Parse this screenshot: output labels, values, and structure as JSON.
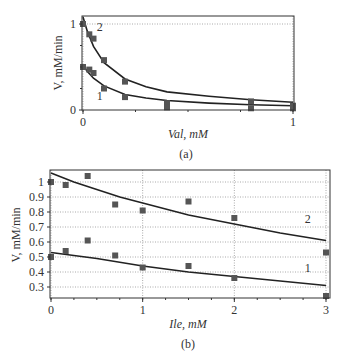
{
  "chart_data": [
    {
      "panel": "(a)",
      "type": "scatter",
      "xlabel": "Val, mM",
      "ylabel": "V, mM/min",
      "xlim": [
        0,
        1
      ],
      "ylim": [
        0,
        1.1
      ],
      "xticks": [
        0,
        1
      ],
      "xtick_labels": [
        "0",
        "1"
      ],
      "yticks": [
        0,
        1
      ],
      "ytick_labels": [
        "0",
        "1"
      ],
      "grid": "dotted reference line at y=1 and x=1",
      "series": [
        {
          "name": "2",
          "points": [
            [
              0,
              1.0
            ],
            [
              0.03,
              0.88
            ],
            [
              0.05,
              0.83
            ],
            [
              0.1,
              0.58
            ],
            [
              0.2,
              0.33
            ],
            [
              0.4,
              0.08
            ],
            [
              0.8,
              0.1
            ],
            [
              1.0,
              0.05
            ]
          ],
          "fit": [
            [
              0,
              1.08
            ],
            [
              0.02,
              0.92
            ],
            [
              0.05,
              0.74
            ],
            [
              0.1,
              0.55
            ],
            [
              0.2,
              0.36
            ],
            [
              0.3,
              0.27
            ],
            [
              0.4,
              0.21
            ],
            [
              0.6,
              0.16
            ],
            [
              0.8,
              0.12
            ],
            [
              1.0,
              0.09
            ]
          ],
          "label_pos": [
            0.08,
            0.92
          ]
        },
        {
          "name": "1",
          "points": [
            [
              0,
              0.5
            ],
            [
              0.03,
              0.47
            ],
            [
              0.05,
              0.43
            ],
            [
              0.1,
              0.25
            ],
            [
              0.2,
              0.15
            ],
            [
              0.4,
              0.03
            ],
            [
              0.8,
              0.02
            ],
            [
              1.0,
              0.02
            ]
          ],
          "fit": [
            [
              0,
              0.52
            ],
            [
              0.02,
              0.45
            ],
            [
              0.05,
              0.37
            ],
            [
              0.1,
              0.28
            ],
            [
              0.2,
              0.18
            ],
            [
              0.3,
              0.14
            ],
            [
              0.4,
              0.11
            ],
            [
              0.6,
              0.08
            ],
            [
              0.8,
              0.06
            ],
            [
              1.0,
              0.05
            ]
          ],
          "label_pos": [
            0.08,
            0.12
          ]
        }
      ]
    },
    {
      "panel": "(b)",
      "type": "scatter",
      "xlabel": "Ile, mM",
      "ylabel": "V, mM/min",
      "xlim": [
        0,
        3
      ],
      "ylim": [
        0.23,
        1.08
      ],
      "xticks": [
        0,
        1,
        2,
        3
      ],
      "xtick_labels": [
        "0",
        "1",
        "2",
        "3"
      ],
      "yticks": [
        0.3,
        0.4,
        0.5,
        0.6,
        0.7,
        0.8,
        0.9,
        1.0
      ],
      "ytick_labels": [
        "0.3",
        "0.4",
        "0.5",
        "0.6",
        "0.7",
        "0.8",
        "0.9",
        "1"
      ],
      "grid": "dotted horizontal and vertical gridlines",
      "series": [
        {
          "name": "2",
          "points": [
            [
              0,
              1.0
            ],
            [
              0.16,
              0.98
            ],
            [
              0.4,
              1.04
            ],
            [
              0.7,
              0.85
            ],
            [
              1.0,
              0.81
            ],
            [
              1.5,
              0.87
            ],
            [
              2.0,
              0.76
            ],
            [
              3.0,
              0.53
            ]
          ],
          "fit": [
            [
              0,
              1.06
            ],
            [
              0.25,
              1.0
            ],
            [
              0.5,
              0.95
            ],
            [
              0.75,
              0.9
            ],
            [
              1.0,
              0.86
            ],
            [
              1.5,
              0.78
            ],
            [
              2.0,
              0.72
            ],
            [
              2.5,
              0.66
            ],
            [
              3.0,
              0.61
            ]
          ],
          "label_pos": [
            2.8,
            0.73
          ]
        },
        {
          "name": "1",
          "points": [
            [
              0,
              0.5
            ],
            [
              0.16,
              0.54
            ],
            [
              0.4,
              0.61
            ],
            [
              0.7,
              0.51
            ],
            [
              1.0,
              0.43
            ],
            [
              1.5,
              0.44
            ],
            [
              2.0,
              0.36
            ],
            [
              3.0,
              0.24
            ]
          ],
          "fit": [
            [
              0,
              0.53
            ],
            [
              0.5,
              0.49
            ],
            [
              1.0,
              0.44
            ],
            [
              1.5,
              0.4
            ],
            [
              2.0,
              0.37
            ],
            [
              2.5,
              0.34
            ],
            [
              3.0,
              0.31
            ]
          ],
          "label_pos": [
            2.8,
            0.4
          ]
        }
      ]
    }
  ],
  "labels": {
    "panel_a": "(a)",
    "panel_b": "(b)",
    "xlabel_a": "Val, mM",
    "xlabel_b": "Ile, mM",
    "ylabel": "V, mM/min"
  },
  "colors": {
    "marker": "#555555",
    "curve": "#222222",
    "frame": "#333333",
    "grid": "#aaaaaa",
    "text": "#333333"
  }
}
